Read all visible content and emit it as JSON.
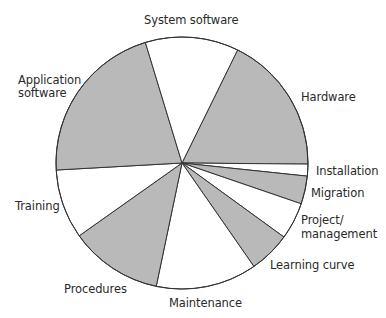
{
  "chart_data": {
    "type": "pie",
    "title": "",
    "center": [
      182,
      163
    ],
    "radius": 126,
    "colors": {
      "shaded": "#b9b9b9",
      "unshaded": "#ffffff",
      "stroke": "#333333"
    },
    "slices": [
      {
        "label": "Hardware",
        "value": 17.9,
        "start_deg": 296.2,
        "end_deg": 360.5,
        "fill": "shaded"
      },
      {
        "label": "Installation",
        "value": 1.5,
        "start_deg": 0.5,
        "end_deg": 6.0,
        "fill": "unshaded"
      },
      {
        "label": "Migration",
        "value": 3.6,
        "start_deg": 6.0,
        "end_deg": 18.9,
        "fill": "shaded"
      },
      {
        "label": "Project/ management",
        "value": 4.8,
        "start_deg": 18.9,
        "end_deg": 36.0,
        "fill": "unshaded"
      },
      {
        "label": "Learning curve",
        "value": 5.3,
        "start_deg": 36.0,
        "end_deg": 55.2,
        "fill": "shaded"
      },
      {
        "label": "Maintenance",
        "value": 12.9,
        "start_deg": 55.2,
        "end_deg": 101.8,
        "fill": "unshaded"
      },
      {
        "label": "Procedures",
        "value": 11.9,
        "start_deg": 101.8,
        "end_deg": 144.7,
        "fill": "shaded"
      },
      {
        "label": "Training",
        "value": 8.9,
        "start_deg": 144.7,
        "end_deg": 176.8,
        "fill": "unshaded"
      },
      {
        "label": "Application software",
        "value": 21.2,
        "start_deg": 176.8,
        "end_deg": 253.1,
        "fill": "shaded"
      },
      {
        "label": "System software",
        "value": 12.0,
        "start_deg": 253.1,
        "end_deg": 296.2,
        "fill": "unshaded"
      }
    ]
  },
  "labels": {
    "system_software": "System software",
    "hardware": "Hardware",
    "application_line1": "Application",
    "application_line2": "software",
    "installation": "Installation",
    "migration": "Migration",
    "project_line1": "Project/",
    "project_line2": "management",
    "learning_curve": "Learning curve",
    "maintenance": "Maintenance",
    "procedures": "Procedures",
    "training": "Training"
  }
}
